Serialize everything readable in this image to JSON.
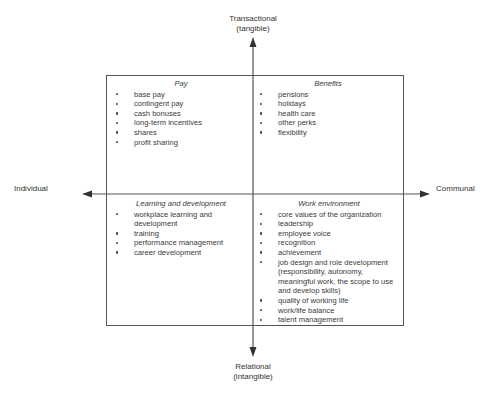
{
  "axes": {
    "top": {
      "line1": "Transactional",
      "line2": "(tangible)"
    },
    "bottom": {
      "line1": "Relational",
      "line2": "(intangible)"
    },
    "left": "Individual",
    "right": "Communal"
  },
  "quadrants": {
    "top_left": {
      "title": "Pay",
      "items": [
        "base pay",
        "contingent pay",
        "cash bonuses",
        "long-term incentives",
        "shares",
        "profit sharing"
      ]
    },
    "top_right": {
      "title": "Benefits",
      "items": [
        "pensions",
        "holidays",
        "health care",
        "other perks",
        "flexibility"
      ]
    },
    "bottom_left": {
      "title": "Learning and development",
      "items": [
        "workplace learning and development",
        "training",
        "performance management",
        "career development"
      ]
    },
    "bottom_right": {
      "title": "Work environment",
      "items": [
        "core values of the organization",
        "leadership",
        "employee voice",
        "recognition",
        "achievement",
        "job design and role development (responsibility, autonomy, meaningful work, the scope to use and develop skills)",
        "quality of working life",
        "work/life balance",
        "talent management"
      ]
    }
  },
  "colors": {
    "line": "#555555",
    "text": "#333333",
    "background": "#ffffff"
  }
}
